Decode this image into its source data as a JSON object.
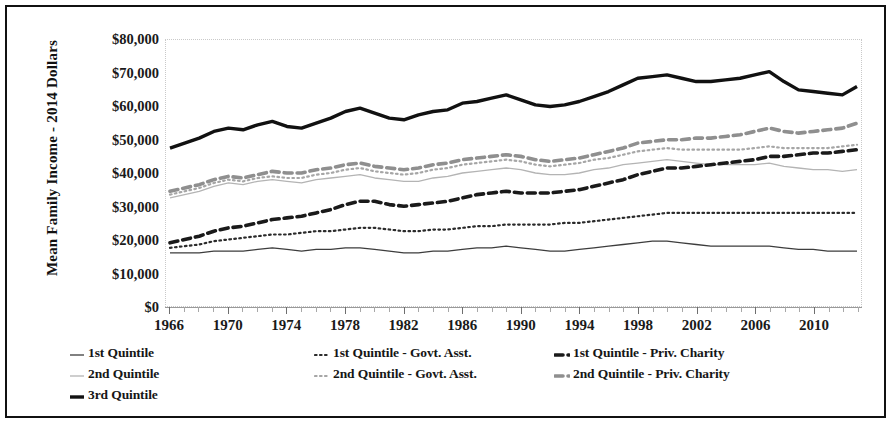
{
  "figure": {
    "frame_color": "#111111",
    "background": "#ffffff"
  },
  "axis": {
    "y_title": "Mean Family Income - 2014 Dollars",
    "y_ticks": [
      "$80,000",
      "$70,000",
      "$60,000",
      "$50,000",
      "$40,000",
      "$30,000",
      "$20,000",
      "$10,000",
      "$0"
    ],
    "x_labels": [
      "1966",
      "1970",
      "1974",
      "1978",
      "1982",
      "1986",
      "1990",
      "1994",
      "1998",
      "2002",
      "2006",
      "2010"
    ]
  },
  "legend": {
    "items": [
      {
        "label": "1st Quintile",
        "style": "thin-solid",
        "color": "#3d3d3d"
      },
      {
        "label": "1st Quintile - Govt. Asst.",
        "style": "dotted",
        "color": "#2b2b2b"
      },
      {
        "label": "1st Quintile - Priv. Charity",
        "style": "thick-dash",
        "color": "#1a1a1a"
      },
      {
        "label": "2nd Quintile",
        "style": "thin-solid",
        "color": "#b4b4b4"
      },
      {
        "label": "2nd Quintile - Govt. Asst.",
        "style": "dotted",
        "color": "#a6a6a6"
      },
      {
        "label": "2nd Quintile - Priv. Charity",
        "style": "thick-dash",
        "color": "#8f8f8f"
      },
      {
        "label": "3rd Quintile",
        "style": "heavy-solid",
        "color": "#111111"
      }
    ]
  },
  "chart_data": {
    "type": "line",
    "title": "",
    "xlabel": "",
    "ylabel": "Mean Family Income - 2014 Dollars",
    "xlim": [
      1966,
      2013
    ],
    "ylim": [
      0,
      80000
    ],
    "ytick_step": 10000,
    "grid": false,
    "legend_position": "bottom",
    "x": [
      1966,
      1967,
      1968,
      1969,
      1970,
      1971,
      1972,
      1973,
      1974,
      1975,
      1976,
      1977,
      1978,
      1979,
      1980,
      1981,
      1982,
      1983,
      1984,
      1985,
      1986,
      1987,
      1988,
      1989,
      1990,
      1991,
      1992,
      1993,
      1994,
      1995,
      1996,
      1997,
      1998,
      1999,
      2000,
      2001,
      2002,
      2003,
      2004,
      2005,
      2006,
      2007,
      2008,
      2009,
      2010,
      2011,
      2012,
      2013
    ],
    "series": [
      {
        "name": "3rd Quintile",
        "style": "heavy-solid",
        "color": "#111111",
        "values": [
          47500,
          49000,
          50500,
          52500,
          53500,
          53000,
          54500,
          55500,
          54000,
          53500,
          55000,
          56500,
          58500,
          59500,
          58000,
          56500,
          56000,
          57500,
          58500,
          59000,
          61000,
          61500,
          62500,
          63500,
          62000,
          60500,
          60000,
          60500,
          61500,
          63000,
          64500,
          66500,
          68500,
          69000,
          69500,
          68500,
          67500,
          67500,
          68000,
          68500,
          69500,
          70500,
          67500,
          65000,
          64500,
          64000,
          63500,
          66000
        ]
      },
      {
        "name": "2nd Quintile - Priv. Charity",
        "style": "thick-dash",
        "color": "#8f8f8f",
        "values": [
          34500,
          35500,
          36500,
          38000,
          39000,
          38500,
          39500,
          40500,
          40000,
          40000,
          41000,
          41500,
          42500,
          43000,
          42000,
          41500,
          41000,
          41500,
          42500,
          43000,
          44000,
          44500,
          45000,
          45500,
          45000,
          44000,
          43500,
          44000,
          44500,
          45500,
          46500,
          47500,
          49000,
          49500,
          50000,
          50000,
          50500,
          50500,
          51000,
          51500,
          52500,
          53500,
          52500,
          52000,
          52500,
          53000,
          53500,
          55000
        ]
      },
      {
        "name": "2nd Quintile - Govt. Asst.",
        "style": "dotted",
        "color": "#a6a6a6",
        "values": [
          33500,
          34500,
          35500,
          37000,
          38000,
          37500,
          38500,
          39000,
          38500,
          38500,
          39500,
          40000,
          41000,
          41500,
          40500,
          40000,
          39500,
          40000,
          41000,
          41500,
          42500,
          43000,
          43500,
          44000,
          43500,
          42500,
          42000,
          42500,
          43000,
          44000,
          44500,
          45500,
          46500,
          47000,
          47500,
          47000,
          47000,
          47000,
          47000,
          47000,
          47500,
          48000,
          47500,
          47500,
          47500,
          47500,
          48000,
          48500
        ]
      },
      {
        "name": "2nd Quintile",
        "style": "thin-solid",
        "color": "#b4b4b4",
        "values": [
          32500,
          33500,
          34500,
          36000,
          37000,
          36500,
          37500,
          38000,
          37500,
          37000,
          38000,
          38500,
          39000,
          39500,
          38500,
          38000,
          37500,
          37500,
          38500,
          39000,
          40000,
          40500,
          41000,
          41500,
          41000,
          40000,
          39500,
          39500,
          40000,
          41000,
          41500,
          42500,
          43000,
          43500,
          44000,
          43500,
          43000,
          42500,
          42500,
          42500,
          42500,
          43000,
          42000,
          41500,
          41000,
          41000,
          40500,
          41000
        ]
      },
      {
        "name": "1st Quintile - Priv. Charity",
        "style": "thick-dash",
        "color": "#1a1a1a",
        "values": [
          19000,
          20000,
          21000,
          22500,
          23500,
          24000,
          25000,
          26000,
          26500,
          27000,
          28000,
          29000,
          30500,
          31500,
          31500,
          30500,
          30000,
          30500,
          31000,
          31500,
          32500,
          33500,
          34000,
          34500,
          34000,
          34000,
          34000,
          34500,
          35000,
          36000,
          37000,
          38000,
          39500,
          40500,
          41500,
          41500,
          42000,
          42500,
          43000,
          43500,
          44000,
          45000,
          45000,
          45500,
          46000,
          46000,
          46500,
          47000
        ]
      },
      {
        "name": "1st Quintile - Govt. Asst.",
        "style": "dotted",
        "color": "#2b2b2b",
        "values": [
          17500,
          18000,
          18500,
          19500,
          20000,
          20500,
          21000,
          21500,
          21500,
          22000,
          22500,
          22500,
          23000,
          23500,
          23500,
          23000,
          22500,
          22500,
          23000,
          23000,
          23500,
          24000,
          24000,
          24500,
          24500,
          24500,
          24500,
          25000,
          25000,
          25500,
          26000,
          26500,
          27000,
          27500,
          28000,
          28000,
          28000,
          28000,
          28000,
          28000,
          28000,
          28000,
          28000,
          28000,
          28000,
          28000,
          28000,
          28000
        ]
      },
      {
        "name": "1st Quintile",
        "style": "thin-solid",
        "color": "#3d3d3d",
        "values": [
          16000,
          16000,
          16000,
          16500,
          16500,
          16500,
          17000,
          17500,
          17000,
          16500,
          17000,
          17000,
          17500,
          17500,
          17000,
          16500,
          16000,
          16000,
          16500,
          16500,
          17000,
          17500,
          17500,
          18000,
          17500,
          17000,
          16500,
          16500,
          17000,
          17500,
          18000,
          18500,
          19000,
          19500,
          19500,
          19000,
          18500,
          18000,
          18000,
          18000,
          18000,
          18000,
          17500,
          17000,
          17000,
          16500,
          16500,
          16500
        ]
      }
    ]
  }
}
